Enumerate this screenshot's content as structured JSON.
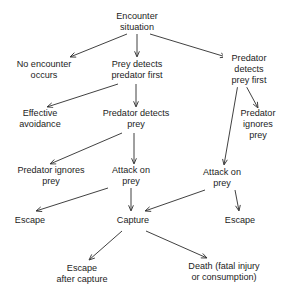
{
  "diagram": {
    "background_color": "#ffffff",
    "text_color": "#1c1c1c",
    "arrow_color": "#2b2b2b",
    "nodes": [
      {
        "id": "encounter-situation",
        "label": "Encounter\nsituation",
        "x": 137,
        "y": 22
      },
      {
        "id": "no-encounter-occurs",
        "label": "No encounter\noccurs",
        "x": 44,
        "y": 70
      },
      {
        "id": "prey-detects-predator-first",
        "label": "Prey detects\npredator first",
        "x": 137,
        "y": 70
      },
      {
        "id": "predator-detects-prey-first",
        "label": "Predator detects\nprey first",
        "x": 249,
        "y": 70
      },
      {
        "id": "effective-avoidance",
        "label": "Effective\navoidance",
        "x": 40,
        "y": 119
      },
      {
        "id": "predator-detects-prey",
        "label": "Predator detects\nprey",
        "x": 136,
        "y": 119
      },
      {
        "id": "predator-ignores-prey-right",
        "label": "Predator\nignores\nprey",
        "x": 258,
        "y": 125
      },
      {
        "id": "predator-ignores-prey-left",
        "label": "Predator ignores\nprey",
        "x": 51,
        "y": 176
      },
      {
        "id": "attack-on-prey-middle",
        "label": "Attack on\nprey",
        "x": 131,
        "y": 176
      },
      {
        "id": "attack-on-prey-right",
        "label": "Attack on\nprey",
        "x": 222,
        "y": 178
      },
      {
        "id": "escape-left",
        "label": "Escape",
        "x": 30,
        "y": 221
      },
      {
        "id": "capture",
        "label": "Capture",
        "x": 133,
        "y": 221
      },
      {
        "id": "escape-right",
        "label": "Escape",
        "x": 240,
        "y": 221
      },
      {
        "id": "escape-after-capture",
        "label": "Escape\nafter capture",
        "x": 82,
        "y": 274
      },
      {
        "id": "death-fatal-injury",
        "label": "Death (fatal injury\nor consumption)",
        "x": 224,
        "y": 272
      }
    ],
    "edges": [
      {
        "id": "edge-encounter-to-no-encounter",
        "from": "encounter-situation",
        "to": "no-encounter-occurs",
        "x1": 127,
        "y1": 34,
        "x2": 70,
        "y2": 57
      },
      {
        "id": "edge-encounter-to-prey-detects",
        "from": "encounter-situation",
        "to": "prey-detects-predator-first",
        "x1": 137,
        "y1": 34,
        "x2": 137,
        "y2": 57
      },
      {
        "id": "edge-encounter-to-predator-detects",
        "from": "encounter-situation",
        "to": "predator-detects-prey-first",
        "x1": 150,
        "y1": 34,
        "x2": 226,
        "y2": 57
      },
      {
        "id": "edge-prey-detects-to-avoidance",
        "from": "prey-detects-predator-first",
        "to": "effective-avoidance",
        "x1": 118,
        "y1": 84,
        "x2": 47,
        "y2": 107
      },
      {
        "id": "edge-prey-detects-to-predator-detects",
        "from": "prey-detects-predator-first",
        "to": "predator-detects-prey",
        "x1": 136,
        "y1": 84,
        "x2": 136,
        "y2": 107
      },
      {
        "id": "edge-predator-detects-prey-first-to-ignores",
        "from": "predator-detects-prey-first",
        "to": "predator-ignores-prey-right",
        "x1": 245,
        "y1": 84,
        "x2": 258,
        "y2": 108
      },
      {
        "id": "edge-predator-detects-prey-first-to-attack",
        "from": "predator-detects-prey-first",
        "to": "attack-on-prey-right",
        "x1": 238,
        "y1": 84,
        "x2": 224,
        "y2": 165
      },
      {
        "id": "edge-predator-detects-to-ignores",
        "from": "predator-detects-prey",
        "to": "predator-ignores-prey-left",
        "x1": 122,
        "y1": 133,
        "x2": 50,
        "y2": 164
      },
      {
        "id": "edge-predator-detects-to-attack",
        "from": "predator-detects-prey",
        "to": "attack-on-prey-middle",
        "x1": 134,
        "y1": 133,
        "x2": 134,
        "y2": 164
      },
      {
        "id": "edge-attack-middle-to-escape-left",
        "from": "attack-on-prey-middle",
        "to": "escape-left",
        "x1": 108,
        "y1": 188,
        "x2": 36,
        "y2": 211
      },
      {
        "id": "edge-attack-middle-to-capture",
        "from": "attack-on-prey-middle",
        "to": "capture",
        "x1": 131,
        "y1": 188,
        "x2": 131,
        "y2": 211
      },
      {
        "id": "edge-attack-right-to-capture",
        "from": "attack-on-prey-right",
        "to": "capture",
        "x1": 205,
        "y1": 190,
        "x2": 145,
        "y2": 211
      },
      {
        "id": "edge-attack-right-to-escape-right",
        "from": "attack-on-prey-right",
        "to": "escape-right",
        "x1": 235,
        "y1": 190,
        "x2": 239,
        "y2": 211
      },
      {
        "id": "edge-capture-to-escape-after",
        "from": "capture",
        "to": "escape-after-capture",
        "x1": 122,
        "y1": 231,
        "x2": 89,
        "y2": 260
      },
      {
        "id": "edge-capture-to-death",
        "from": "capture",
        "to": "death-fatal-injury",
        "x1": 146,
        "y1": 231,
        "x2": 207,
        "y2": 258
      }
    ]
  }
}
